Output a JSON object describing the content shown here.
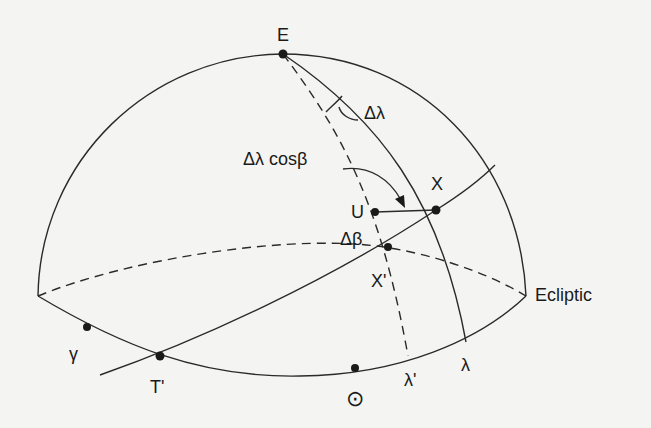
{
  "diagram": {
    "colors": {
      "line": "#2a2a2a",
      "background": "#f4f4f2",
      "text": "#1a1a1a"
    },
    "labels": {
      "pole": "E",
      "delta_lambda": "Δλ",
      "delta_lambda_cos_beta": "Δλ cosβ",
      "point_x": "X",
      "point_u": "U",
      "delta_beta": "Δβ",
      "point_x_prime": "X'",
      "ecliptic": "Ecliptic",
      "vernal_equinox": "γ",
      "point_t_prime": "T'",
      "sun": "⊙",
      "lambda_prime": "λ'",
      "lambda": "λ"
    },
    "points": [
      {
        "name": "E",
        "x": 283,
        "y": 54
      },
      {
        "name": "U",
        "x": 375,
        "y": 212
      },
      {
        "name": "X",
        "x": 436,
        "y": 210
      },
      {
        "name": "X'",
        "x": 388,
        "y": 247
      },
      {
        "name": "γ",
        "x": 87,
        "y": 327
      },
      {
        "name": "T'",
        "x": 160,
        "y": 356
      },
      {
        "name": "Sun",
        "x": 355,
        "y": 368
      }
    ]
  }
}
